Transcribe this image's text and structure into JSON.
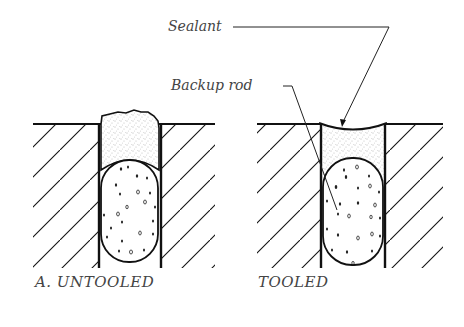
{
  "labels": {
    "sealant": "Sealant",
    "backup_rod": "Backup rod",
    "untooled": "A. UNTOOLED",
    "tooled": "TOOLED"
  },
  "colors": {
    "ink": "#111111",
    "text": "#444444",
    "stipple": "#666666",
    "background": "#ffffff"
  },
  "panels": [
    {
      "id": "untooled",
      "surface_x": [
        33,
        215
      ],
      "surface_y": 124,
      "joint_x": [
        99,
        161
      ],
      "bottom_y": 268
    },
    {
      "id": "tooled",
      "surface_x": [
        257,
        443
      ],
      "surface_y": 124,
      "joint_x": [
        321,
        385
      ],
      "bottom_y": 268
    }
  ]
}
